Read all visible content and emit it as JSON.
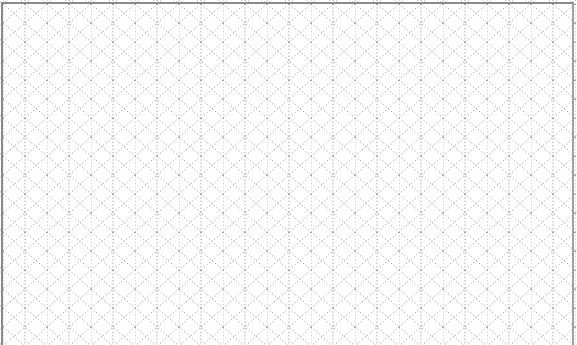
{
  "sheet": {
    "kind": "isometric-dotted-grid-paper",
    "line_color": "#9a9a9a",
    "border_color": "#8a8a8a",
    "background": "#ffffff",
    "cell_width": 22,
    "cell_height": 38
  }
}
